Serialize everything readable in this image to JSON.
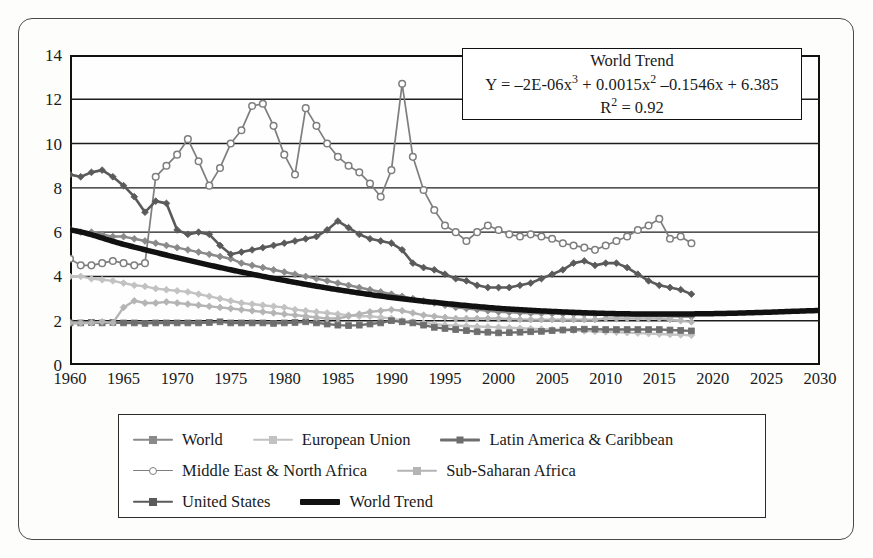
{
  "figure": {
    "background": "#fdfdfc",
    "frame_color": "#4a4a4a"
  },
  "equation_box": {
    "title": "World Trend",
    "formula_plain": "Y = –2E-06x³ + 0.0015x² –0.1546x + 6.385",
    "formula_prefix": "Y = –2E-06x",
    "formula_mid": " + 0.0015x",
    "formula_suffix": " –0.1546x + 6.385",
    "exp3": "3",
    "exp2": "2",
    "r2_prefix": "R",
    "r2_exp": "2",
    "r2_value": " = 0.92"
  },
  "legend": {
    "rows": [
      [
        {
          "label": "World",
          "color": "#8a8a8a",
          "marker": "diamond",
          "width": 2.6
        },
        {
          "label": "European Union",
          "color": "#c2c2c2",
          "marker": "diamond",
          "width": 2.6
        },
        {
          "label": "Latin America & Caribbean",
          "color": "#6e6e6e",
          "marker": "square",
          "width": 3.0
        }
      ],
      [
        {
          "label": "Middle East & North Africa",
          "color": "#7e7e7e",
          "marker": "circle-open",
          "width": 1.8
        },
        {
          "label": "Sub-Saharan Africa",
          "color": "#b4b4b4",
          "marker": "diamond",
          "width": 2.6
        }
      ],
      [
        {
          "label": "United States",
          "color": "#5a5a5a",
          "marker": "diamond",
          "width": 2.6
        },
        {
          "label": "World Trend",
          "color": "#111111",
          "marker": "none",
          "width": 6.0
        }
      ]
    ]
  },
  "chart_data": {
    "type": "line",
    "title": "",
    "xlabel": "",
    "ylabel": "",
    "xlim": [
      1960,
      2030
    ],
    "ylim": [
      0,
      14
    ],
    "xticks": [
      1960,
      1965,
      1970,
      1975,
      1980,
      1985,
      1990,
      1995,
      2000,
      2005,
      2010,
      2015,
      2020,
      2025,
      2030
    ],
    "yticks": [
      0,
      2,
      4,
      6,
      8,
      10,
      12,
      14
    ],
    "grid": "horizontal",
    "legend_position": "below-plot",
    "annotations": [
      {
        "text": "World Trend",
        "type": "box-title"
      },
      {
        "text": "Y = –2E-06x³ + 0.0015x² –0.1546x + 6.385",
        "type": "trend-equation"
      },
      {
        "text": "R² = 0.92",
        "type": "r-squared"
      }
    ],
    "x": [
      1960,
      1961,
      1962,
      1963,
      1964,
      1965,
      1966,
      1967,
      1968,
      1969,
      1970,
      1971,
      1972,
      1973,
      1974,
      1975,
      1976,
      1977,
      1978,
      1979,
      1980,
      1981,
      1982,
      1983,
      1984,
      1985,
      1986,
      1987,
      1988,
      1989,
      1990,
      1991,
      1992,
      1993,
      1994,
      1995,
      1996,
      1997,
      1998,
      1999,
      2000,
      2001,
      2002,
      2003,
      2004,
      2005,
      2006,
      2007,
      2008,
      2009,
      2010,
      2011,
      2012,
      2013,
      2014,
      2015,
      2016,
      2017,
      2018
    ],
    "series": [
      {
        "name": "World",
        "color": "#8a8a8a",
        "marker": "diamond",
        "linewidth": 2.4,
        "values": [
          6.1,
          6.0,
          6.0,
          5.9,
          5.8,
          5.8,
          5.7,
          5.6,
          5.5,
          5.4,
          5.3,
          5.2,
          5.1,
          5.0,
          4.9,
          4.8,
          4.6,
          4.5,
          4.4,
          4.3,
          4.2,
          4.1,
          4.0,
          3.9,
          3.8,
          3.7,
          3.6,
          3.5,
          3.4,
          3.3,
          3.2,
          3.1,
          3.0,
          2.9,
          2.8,
          2.7,
          2.6,
          2.55,
          2.5,
          2.45,
          2.4,
          2.38,
          2.36,
          2.34,
          2.33,
          2.32,
          2.31,
          2.3,
          2.29,
          2.28,
          2.27,
          2.25,
          2.24,
          2.23,
          2.22,
          2.21,
          2.2,
          2.19,
          2.18
        ]
      },
      {
        "name": "European Union",
        "color": "#c2c2c2",
        "marker": "diamond",
        "linewidth": 2.4,
        "values": [
          4.0,
          4.0,
          3.9,
          3.85,
          3.8,
          3.7,
          3.6,
          3.55,
          3.45,
          3.4,
          3.35,
          3.3,
          3.2,
          3.1,
          3.0,
          2.9,
          2.8,
          2.75,
          2.7,
          2.65,
          2.6,
          2.5,
          2.45,
          2.4,
          2.35,
          2.3,
          2.25,
          2.2,
          2.2,
          2.15,
          2.1,
          2.0,
          1.95,
          1.9,
          1.85,
          1.8,
          1.78,
          1.76,
          1.74,
          1.72,
          1.7,
          1.68,
          1.66,
          1.64,
          1.62,
          1.6,
          1.58,
          1.56,
          1.54,
          1.52,
          1.5,
          1.48,
          1.46,
          1.44,
          1.42,
          1.4,
          1.38,
          1.36,
          1.34
        ]
      },
      {
        "name": "Latin America & Caribbean",
        "color": "#6e6e6e",
        "marker": "square",
        "linewidth": 2.4,
        "values": [
          1.9,
          1.9,
          1.92,
          1.9,
          1.92,
          1.9,
          1.9,
          1.88,
          1.9,
          1.9,
          1.9,
          1.9,
          1.9,
          1.92,
          1.95,
          1.9,
          1.9,
          1.9,
          1.9,
          1.88,
          1.9,
          1.92,
          1.95,
          1.9,
          1.85,
          1.8,
          1.78,
          1.8,
          1.85,
          1.9,
          2.0,
          1.95,
          1.9,
          1.8,
          1.7,
          1.65,
          1.6,
          1.55,
          1.5,
          1.48,
          1.45,
          1.46,
          1.48,
          1.5,
          1.52,
          1.55,
          1.58,
          1.6,
          1.62,
          1.62,
          1.6,
          1.6,
          1.6,
          1.6,
          1.6,
          1.6,
          1.58,
          1.56,
          1.54
        ]
      },
      {
        "name": "Middle East & North Africa",
        "color": "#7e7e7e",
        "marker": "circle-open",
        "linewidth": 1.7,
        "values": [
          4.8,
          4.5,
          4.5,
          4.6,
          4.7,
          4.6,
          4.5,
          4.6,
          8.5,
          9.0,
          9.5,
          10.2,
          9.2,
          8.1,
          8.9,
          10.0,
          10.6,
          11.7,
          11.8,
          10.8,
          9.5,
          8.6,
          11.6,
          10.8,
          10.0,
          9.4,
          9.0,
          8.7,
          8.2,
          7.6,
          8.8,
          12.7,
          9.4,
          7.9,
          7.0,
          6.3,
          6.0,
          5.6,
          6.0,
          6.3,
          6.1,
          5.9,
          5.8,
          5.9,
          5.8,
          5.7,
          5.5,
          5.4,
          5.3,
          5.2,
          5.4,
          5.6,
          5.8,
          6.1,
          6.3,
          6.6,
          5.7,
          5.8,
          5.5
        ]
      },
      {
        "name": "Sub-Saharan Africa",
        "color": "#b4b4b4",
        "marker": "diamond",
        "linewidth": 2.4,
        "values": [
          1.9,
          1.9,
          1.9,
          1.95,
          1.9,
          2.6,
          2.9,
          2.8,
          2.8,
          2.85,
          2.8,
          2.75,
          2.7,
          2.65,
          2.6,
          2.55,
          2.5,
          2.45,
          2.4,
          2.35,
          2.3,
          2.25,
          2.2,
          2.15,
          2.1,
          2.1,
          2.2,
          2.3,
          2.4,
          2.45,
          2.5,
          2.45,
          2.35,
          2.25,
          2.2,
          2.15,
          2.1,
          2.1,
          2.1,
          2.1,
          2.1,
          2.08,
          2.06,
          2.05,
          2.05,
          2.05,
          2.05,
          2.05,
          2.05,
          2.05,
          2.1,
          2.1,
          2.1,
          2.1,
          2.1,
          2.1,
          2.05,
          2.0,
          1.95
        ]
      },
      {
        "name": "United States",
        "color": "#5a5a5a",
        "marker": "diamond",
        "linewidth": 2.6,
        "values": [
          8.6,
          8.5,
          8.7,
          8.8,
          8.5,
          8.1,
          7.6,
          6.9,
          7.4,
          7.3,
          6.1,
          5.9,
          6.0,
          5.9,
          5.4,
          5.0,
          5.1,
          5.2,
          5.3,
          5.4,
          5.5,
          5.6,
          5.7,
          5.8,
          6.1,
          6.5,
          6.2,
          5.9,
          5.7,
          5.6,
          5.5,
          5.2,
          4.6,
          4.4,
          4.3,
          4.1,
          3.9,
          3.8,
          3.6,
          3.5,
          3.5,
          3.5,
          3.6,
          3.7,
          3.9,
          4.1,
          4.3,
          4.6,
          4.7,
          4.5,
          4.6,
          4.6,
          4.4,
          4.1,
          3.8,
          3.6,
          3.5,
          3.4,
          3.2
        ]
      }
    ],
    "trend": {
      "name": "World Trend",
      "color": "#111111",
      "linewidth": 5.5,
      "equation": "Y = -2E-06x^3 + 0.0015x^2 -0.1546x + 6.385",
      "r_squared": 0.92,
      "x": [
        1960,
        1965,
        1970,
        1975,
        1980,
        1985,
        1990,
        1995,
        2000,
        2005,
        2010,
        2015,
        2020,
        2025,
        2030
      ],
      "values": [
        6.1,
        5.45,
        4.85,
        4.3,
        3.82,
        3.4,
        3.05,
        2.78,
        2.56,
        2.42,
        2.33,
        2.3,
        2.32,
        2.38,
        2.46
      ]
    }
  }
}
